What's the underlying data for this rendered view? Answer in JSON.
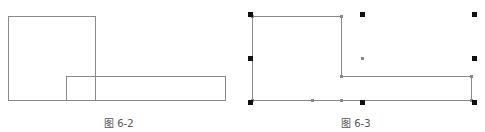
{
  "figures": [
    {
      "id": "fig-6-2",
      "caption": "图 6-2",
      "description": "Two overlapping rectangles: a tall square and a long horizontal rectangle overlapping its lower-right corner",
      "line_color": "#8a8a8a"
    },
    {
      "id": "fig-6-3",
      "caption": "图 6-3",
      "description": "Union outline of the two rectangles (L-shaped polygon) shown selected with grips",
      "line_color": "#8a8a8a",
      "grip_color": "#111111",
      "vertex_color": "#888888"
    }
  ]
}
